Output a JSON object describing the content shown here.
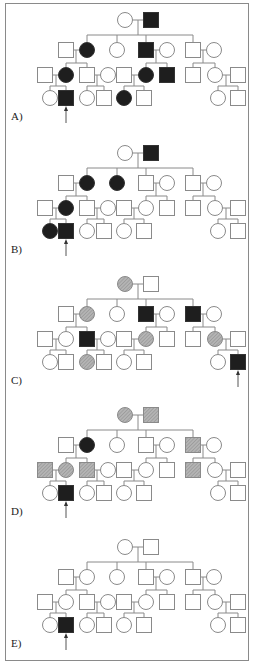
{
  "figure": {
    "colors": {
      "line": "#8a8a8a",
      "affected": "#1e1e1e",
      "carrier": "#a9a9a9",
      "open": "#ffffff"
    },
    "legend_key": {
      "F": "affected (filled black)",
      "H": "hatched gray",
      "O": "unaffected (open)"
    },
    "layout": {
      "gen_y": [
        20,
        50,
        75,
        98
      ],
      "sib_y": 35,
      "gen1": [
        {
          "shape": "circle",
          "x": 125
        },
        {
          "shape": "square",
          "x": 151
        }
      ],
      "gen2": [
        {
          "shape": "square",
          "x": 66
        },
        {
          "shape": "circle",
          "x": 87
        },
        {
          "shape": "circle",
          "x": 117
        },
        {
          "shape": "square",
          "x": 146
        },
        {
          "shape": "circle",
          "x": 167
        },
        {
          "shape": "square",
          "x": 193
        },
        {
          "shape": "circle",
          "x": 214
        }
      ],
      "gen3": [
        {
          "shape": "square",
          "x": 45
        },
        {
          "shape": "circle",
          "x": 66
        },
        {
          "shape": "square",
          "x": 87
        },
        {
          "shape": "circle",
          "x": 108
        },
        {
          "shape": "square",
          "x": 124
        },
        {
          "shape": "circle",
          "x": 146
        },
        {
          "shape": "square",
          "x": 167
        },
        {
          "shape": "square",
          "x": 193
        },
        {
          "shape": "circle",
          "x": 215
        },
        {
          "shape": "square",
          "x": 238
        }
      ],
      "gen4": [
        {
          "shape": "circle",
          "x": 50
        },
        {
          "shape": "square",
          "x": 66
        },
        {
          "shape": "circle",
          "x": 87
        },
        {
          "shape": "square",
          "x": 104
        },
        {
          "shape": "circle",
          "x": 124
        },
        {
          "shape": "square",
          "x": 144
        },
        {
          "shape": "circle",
          "x": 218
        },
        {
          "shape": "square",
          "x": 238
        }
      ]
    },
    "panels": [
      {
        "label": "A)",
        "top": 0,
        "gen1": [
          "O",
          "F"
        ],
        "gen2": [
          "O",
          "F",
          "O",
          "F",
          "O",
          "O",
          "O"
        ],
        "gen3": [
          "O",
          "F",
          "O",
          "O",
          "O",
          "F",
          "F",
          "O",
          "O",
          "O"
        ],
        "gen4": [
          "O",
          "F",
          "O",
          "O",
          "F",
          "O",
          "O",
          "O"
        ],
        "proband_x": 66
      },
      {
        "label": "B)",
        "top": 133,
        "gen1": [
          "O",
          "F"
        ],
        "gen2": [
          "O",
          "F",
          "F",
          "O",
          "O",
          "O",
          "O"
        ],
        "gen3": [
          "O",
          "F",
          "O",
          "O",
          "O",
          "O",
          "O",
          "O",
          "O",
          "O"
        ],
        "gen4": [
          "F",
          "F",
          "O",
          "O",
          "O",
          "O",
          "O",
          "O"
        ],
        "proband_x": 66
      },
      {
        "label": "C)",
        "top": 264,
        "gen1": [
          "H",
          "O"
        ],
        "gen2": [
          "O",
          "H",
          "O",
          "F",
          "O",
          "F",
          "O"
        ],
        "gen3": [
          "O",
          "O",
          "F",
          "O",
          "O",
          "H",
          "O",
          "O",
          "H",
          "O"
        ],
        "gen4": [
          "O",
          "O",
          "H",
          "O",
          "O",
          "O",
          "O",
          "F"
        ],
        "proband_x": 238
      },
      {
        "label": "D)",
        "top": 395,
        "gen1": [
          "H",
          "H"
        ],
        "gen2": [
          "O",
          "F",
          "O",
          "O",
          "O",
          "H",
          "O"
        ],
        "gen3": [
          "H",
          "H",
          "H",
          "O",
          "O",
          "O",
          "O",
          "H",
          "O",
          "O"
        ],
        "gen4": [
          "O",
          "F",
          "O",
          "O",
          "O",
          "O",
          "O",
          "O"
        ],
        "proband_x": 66
      },
      {
        "label": "E)",
        "top": 527,
        "gen1": [
          "O",
          "O"
        ],
        "gen2": [
          "O",
          "O",
          "O",
          "O",
          "O",
          "O",
          "O"
        ],
        "gen3": [
          "O",
          "O",
          "O",
          "O",
          "O",
          "O",
          "O",
          "O",
          "O",
          "O"
        ],
        "gen4": [
          "O",
          "F",
          "O",
          "O",
          "O",
          "O",
          "O",
          "O"
        ],
        "proband_x": 66
      }
    ]
  }
}
